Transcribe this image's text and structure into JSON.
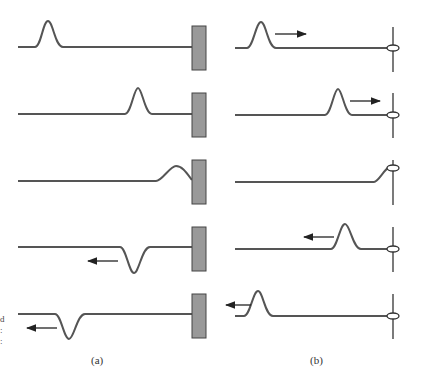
{
  "figure": {
    "panel_a": {
      "label": "(a)",
      "description": "Pulse reflection from fixed end (wall)"
    },
    "panel_b": {
      "label": "(b)",
      "description": "Pulse reflection from free end (ring on pole)"
    },
    "edge_text": [
      "d",
      ":",
      ":"
    ],
    "colors": {
      "string": "#555555",
      "wall": "#999999",
      "wall_edge": "#444444",
      "arrow": "#222222",
      "pole": "#333333"
    }
  }
}
